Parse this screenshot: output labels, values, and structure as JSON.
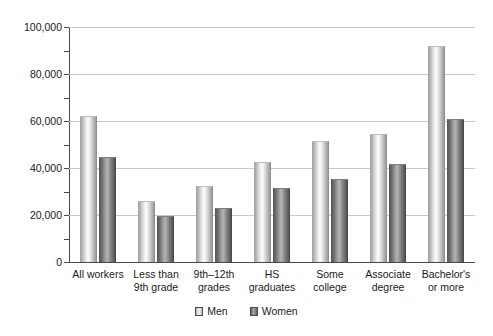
{
  "chart_data": {
    "type": "bar",
    "title": "",
    "subtitle": "",
    "xlabel": "",
    "ylabel": "",
    "ylim": [
      0,
      100000
    ],
    "ytick_step": 20000,
    "yminor_step": 10000,
    "grid": true,
    "legend_position": "bottom-center",
    "ytick_labels": [
      "0",
      "20,000",
      "40,000",
      "60,000",
      "80,000",
      "100,000"
    ],
    "ytick_values": [
      0,
      20000,
      40000,
      60000,
      80000,
      100000
    ],
    "categories": [
      "All workers",
      "Less than\n9th grade",
      "9th–12th\ngrades",
      "HS\ngraduates",
      "Some\ncollege",
      "Associate\ndegree",
      "Bachelor's\nor more"
    ],
    "series": [
      {
        "name": "Men",
        "color": "#e8e8e8",
        "values": [
          62000,
          26000,
          32500,
          42500,
          51500,
          54500,
          92000
        ]
      },
      {
        "name": "Women",
        "color": "#8a8a8a",
        "values": [
          44500,
          19500,
          23000,
          31500,
          35500,
          41500,
          61000
        ]
      }
    ]
  },
  "legend": {
    "items": [
      {
        "label": "Men",
        "swatch": "men-swatch-icon"
      },
      {
        "label": "Women",
        "swatch": "women-swatch-icon"
      }
    ]
  }
}
